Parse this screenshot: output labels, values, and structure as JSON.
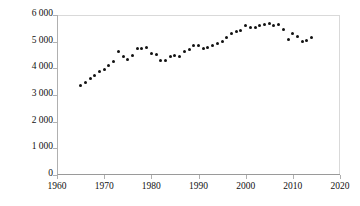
{
  "chart_data": {
    "type": "scatter",
    "title": "",
    "subtitle": "",
    "xlabel": "",
    "ylabel": "",
    "xlim": [
      1960,
      2020
    ],
    "ylim": [
      0,
      6000
    ],
    "xticks": [
      1960,
      1970,
      1980,
      1990,
      2000,
      2010,
      2020
    ],
    "xtick_labels": [
      "1960",
      "1970",
      "1980",
      "1990",
      "2000",
      "2010",
      "2020"
    ],
    "yticks": [
      0,
      1000,
      2000,
      3000,
      4000,
      5000,
      6000
    ],
    "ytick_labels": [
      "0",
      "1 000",
      "2 000",
      "3 000",
      "4 000",
      "5 000",
      "6 000"
    ],
    "grid": false,
    "legend": false,
    "legend_position": "none",
    "marker": "filled-circle",
    "marker_color": "#111111",
    "x": [
      1965,
      1966,
      1967,
      1968,
      1969,
      1970,
      1971,
      1972,
      1973,
      1974,
      1975,
      1976,
      1977,
      1978,
      1979,
      1980,
      1981,
      1982,
      1983,
      1984,
      1985,
      1986,
      1987,
      1988,
      1989,
      1990,
      1991,
      1992,
      1993,
      1994,
      1995,
      1996,
      1997,
      1998,
      1999,
      2000,
      2001,
      2002,
      2003,
      2004,
      2005,
      2006,
      2007,
      2008,
      2009,
      2010,
      2011,
      2012,
      2013,
      2014
    ],
    "values": [
      3350,
      3480,
      3630,
      3720,
      3880,
      3960,
      4100,
      4250,
      4640,
      4450,
      4330,
      4500,
      4750,
      4760,
      4790,
      4540,
      4510,
      4300,
      4280,
      4450,
      4480,
      4450,
      4630,
      4700,
      4870,
      4840,
      4760,
      4770,
      4860,
      4930,
      5000,
      5170,
      5320,
      5390,
      5420,
      5620,
      5540,
      5520,
      5600,
      5650,
      5680,
      5610,
      5640,
      5460,
      5100,
      5290,
      5180,
      5010,
      5060,
      5150
    ],
    "series": [
      {
        "name": "values",
        "values": [
          3350,
          3480,
          3630,
          3720,
          3880,
          3960,
          4100,
          4250,
          4640,
          4450,
          4330,
          4500,
          4750,
          4760,
          4790,
          4540,
          4510,
          4300,
          4280,
          4450,
          4480,
          4450,
          4630,
          4700,
          4870,
          4840,
          4760,
          4770,
          4860,
          4930,
          5000,
          5170,
          5320,
          5390,
          5420,
          5620,
          5540,
          5520,
          5600,
          5650,
          5680,
          5610,
          5640,
          5460,
          5100,
          5290,
          5180,
          5010,
          5060,
          5150
        ]
      }
    ]
  }
}
